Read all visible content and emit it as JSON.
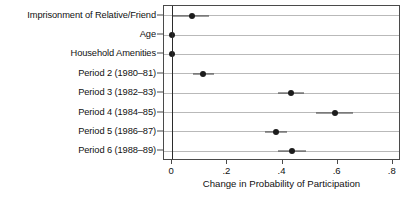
{
  "chart_data": {
    "type": "scatter",
    "title": "",
    "subtitle": "",
    "xlabel": "Change in Probability of Participation",
    "ylabel": "",
    "xlim": [
      -0.03,
      0.83
    ],
    "xticks": [
      0,
      0.2,
      0.4,
      0.6,
      0.8
    ],
    "xticklabels": [
      "0",
      ".2",
      ".4",
      ".6",
      ".8"
    ],
    "grid": "horizontal",
    "legend": "none",
    "reference_line_x": 0,
    "orientation": "horizontal",
    "marker": "filled-circle",
    "error_bars": "horizontal-confidence-interval",
    "categories": [
      "Imprisonment of Relative/Friend",
      "Age",
      "Household Amenities",
      "Period 2 (1980–81)",
      "Period 3 (1982–83)",
      "Period 4 (1984–85)",
      "Period 5 (1986–87)",
      "Period 6 (1988–89)"
    ],
    "points": [
      {
        "label": "Imprisonment of Relative/Friend",
        "estimate": 0.07,
        "ci_low": 0.0,
        "ci_high": 0.135
      },
      {
        "label": "Age",
        "estimate": 0.0,
        "ci_low": -0.005,
        "ci_high": 0.005
      },
      {
        "label": "Household Amenities",
        "estimate": 0.0,
        "ci_low": -0.008,
        "ci_high": 0.008
      },
      {
        "label": "Period 2 (1980–81)",
        "estimate": 0.112,
        "ci_low": 0.075,
        "ci_high": 0.152
      },
      {
        "label": "Period 3 (1982–83)",
        "estimate": 0.43,
        "ci_low": 0.385,
        "ci_high": 0.478
      },
      {
        "label": "Period 4 (1984–85)",
        "estimate": 0.59,
        "ci_low": 0.52,
        "ci_high": 0.655
      },
      {
        "label": "Period 5 (1986–87)",
        "estimate": 0.375,
        "ci_low": 0.335,
        "ci_high": 0.415
      },
      {
        "label": "Period 6 (1988–89)",
        "estimate": 0.435,
        "ci_low": 0.385,
        "ci_high": 0.485
      }
    ],
    "colors": {
      "marker": "#1c1c1c",
      "error_bar": "#3a3a3a",
      "gridline": "#b9b9b9",
      "reference_line": "#2b2b2b",
      "frame": "#4a4a4a",
      "background": "#ffffff",
      "text": "#111111"
    }
  }
}
